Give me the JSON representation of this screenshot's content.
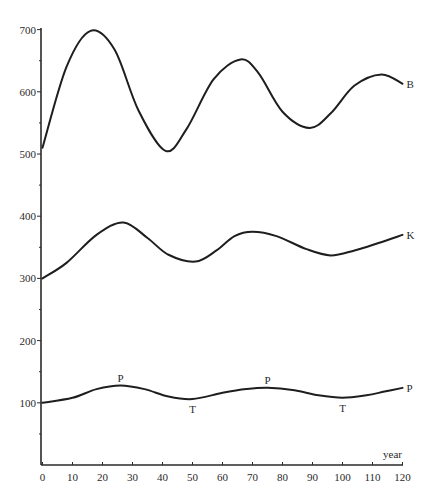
{
  "chart_data": {
    "type": "line",
    "title": "",
    "xlabel": "year",
    "ylabel": "",
    "xlim": [
      0,
      120
    ],
    "ylim": [
      0,
      700
    ],
    "grid": false,
    "legend": "inline labels at right end of each curve",
    "x_ticks": [
      0,
      10,
      20,
      30,
      40,
      50,
      60,
      70,
      80,
      90,
      100,
      110,
      120
    ],
    "y_ticks": [
      100,
      200,
      300,
      400,
      500,
      600,
      700
    ],
    "y_minor_ticks": [
      50,
      150,
      250,
      350,
      450,
      550,
      650
    ],
    "series": [
      {
        "name": "B",
        "points": [
          [
            0,
            510
          ],
          [
            8,
            640
          ],
          [
            16,
            698
          ],
          [
            24,
            668
          ],
          [
            32,
            570
          ],
          [
            41,
            505
          ],
          [
            48,
            540
          ],
          [
            57,
            620
          ],
          [
            66,
            652
          ],
          [
            72,
            630
          ],
          [
            80,
            568
          ],
          [
            89,
            542
          ],
          [
            96,
            565
          ],
          [
            104,
            610
          ],
          [
            113,
            628
          ],
          [
            120,
            613
          ]
        ]
      },
      {
        "name": "K",
        "points": [
          [
            0,
            300
          ],
          [
            8,
            325
          ],
          [
            18,
            370
          ],
          [
            27,
            390
          ],
          [
            35,
            365
          ],
          [
            42,
            338
          ],
          [
            51,
            327
          ],
          [
            58,
            345
          ],
          [
            64,
            368
          ],
          [
            70,
            375
          ],
          [
            78,
            368
          ],
          [
            88,
            347
          ],
          [
            96,
            337
          ],
          [
            104,
            345
          ],
          [
            112,
            357
          ],
          [
            120,
            370
          ]
        ]
      },
      {
        "name": "P",
        "points": [
          [
            0,
            100
          ],
          [
            10,
            108
          ],
          [
            18,
            122
          ],
          [
            26,
            128
          ],
          [
            34,
            122
          ],
          [
            42,
            110
          ],
          [
            50,
            106
          ],
          [
            60,
            116
          ],
          [
            68,
            122
          ],
          [
            75,
            124
          ],
          [
            84,
            120
          ],
          [
            92,
            112
          ],
          [
            100,
            108
          ],
          [
            108,
            112
          ],
          [
            114,
            118
          ],
          [
            120,
            124
          ]
        ]
      }
    ],
    "annotations": [
      {
        "text": "P",
        "x": 26,
        "y": 140
      },
      {
        "text": "T",
        "x": 50,
        "y": 90
      },
      {
        "text": "P",
        "x": 75,
        "y": 137
      },
      {
        "text": "T",
        "x": 100,
        "y": 92
      }
    ]
  },
  "labels": {
    "x_axis": "year",
    "series_B": "B",
    "series_K": "K",
    "series_P": "P"
  }
}
